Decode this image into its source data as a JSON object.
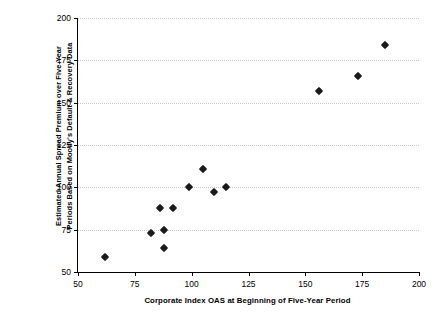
{
  "chart_data": {
    "type": "scatter",
    "title": "",
    "xlabel": "Corporate Index OAS at Beginning of Five-Year Period",
    "ylabel_lines": [
      "Estimated Annual Spread Premium over Five-Year",
      "Periods Based on Moody's Default & Recovery Data"
    ],
    "ylabel": "Estimated Annual Spread Premium over Five-Year Periods Based on Moody's Default & Recovery Data",
    "xlim": [
      50,
      200
    ],
    "ylim": [
      50,
      200
    ],
    "xticks": [
      50,
      75,
      100,
      125,
      150,
      175,
      200
    ],
    "yticks": [
      50,
      75,
      100,
      125,
      150,
      175,
      200
    ],
    "grid": "horizontal-dotted",
    "legend": null,
    "marker": "diamond",
    "marker_color": "#1a1a1a",
    "points": [
      {
        "x": 62,
        "y": 59
      },
      {
        "x": 82,
        "y": 73
      },
      {
        "x": 88,
        "y": 75
      },
      {
        "x": 88,
        "y": 64
      },
      {
        "x": 86,
        "y": 88
      },
      {
        "x": 92,
        "y": 88
      },
      {
        "x": 99,
        "y": 100
      },
      {
        "x": 105,
        "y": 111
      },
      {
        "x": 110,
        "y": 97
      },
      {
        "x": 115,
        "y": 100
      },
      {
        "x": 156,
        "y": 157
      },
      {
        "x": 173,
        "y": 166
      },
      {
        "x": 185,
        "y": 184
      }
    ]
  }
}
